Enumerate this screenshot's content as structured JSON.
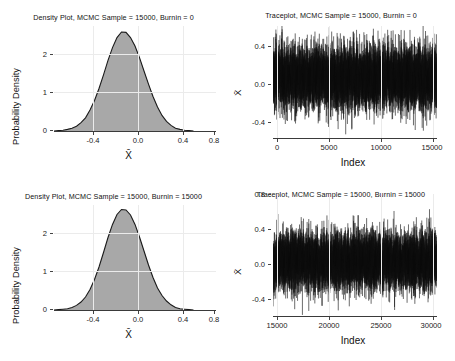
{
  "figure": {
    "background": "#ffffff",
    "panel_count": 4,
    "layout": "2x2 grid"
  },
  "colors": {
    "density_fill_light": "#a8a8a8",
    "density_fill_dark": "#6f6f6f",
    "density_outline": "#1a1a1a",
    "trace_line": "#111111",
    "gridline": "#ebebeb",
    "axis": "#3a3a3a",
    "text": "#111111"
  },
  "chart_data": [
    {
      "type": "area",
      "panel": "top-left",
      "title": "Density Plot, MCMC Sample = 15000, Burnin = 0",
      "xlabel": "X̄",
      "ylabel": "Probability Density",
      "xlim": [
        -0.62,
        0.82
      ],
      "ylim": [
        0,
        2.62
      ],
      "xticks": [
        -0.4,
        0.0,
        0.4,
        0.8
      ],
      "xticklabels": [
        "-0.4",
        "0.0",
        "0.4",
        "0.8"
      ],
      "yticks": [
        0,
        1,
        2
      ],
      "yticklabels": [
        "0",
        "1",
        "2"
      ],
      "grid": true,
      "mean": 0.055,
      "sd": 0.165,
      "peak_density": 2.45,
      "shaded_interval": [
        -0.05,
        0.175
      ],
      "shaded_interval_label": "credible interval (darker band)",
      "x": [
        -0.62,
        -0.58,
        -0.54,
        -0.5,
        -0.46,
        -0.42,
        -0.38,
        -0.34,
        -0.3,
        -0.26,
        -0.22,
        -0.18,
        -0.14,
        -0.1,
        -0.06,
        -0.02,
        0.02,
        0.06,
        0.1,
        0.14,
        0.18,
        0.22,
        0.26,
        0.3,
        0.34,
        0.38,
        0.42,
        0.46,
        0.5,
        0.54,
        0.58,
        0.62,
        0.66,
        0.7,
        0.74,
        0.78,
        0.82
      ],
      "y": [
        0.0,
        0.01,
        0.02,
        0.04,
        0.07,
        0.12,
        0.21,
        0.33,
        0.52,
        0.76,
        1.06,
        1.4,
        1.76,
        2.08,
        2.33,
        2.45,
        2.44,
        2.33,
        2.12,
        1.83,
        1.5,
        1.17,
        0.86,
        0.6,
        0.39,
        0.24,
        0.14,
        0.07,
        0.04,
        0.02,
        0.01,
        0.0,
        0.0,
        0.0,
        0.0,
        0.0,
        0.0
      ]
    },
    {
      "type": "line",
      "panel": "top-right",
      "title": "Traceplot, MCMC Sample = 15000, Burnin = 0",
      "xlabel": "Index",
      "ylabel": "X̄",
      "xlim": [
        0,
        15000
      ],
      "ylim": [
        -0.62,
        0.62
      ],
      "xticks": [
        0,
        5000,
        10000,
        15000
      ],
      "xticklabels": [
        "0",
        "5000",
        "10000",
        "15000"
      ],
      "yticks": [
        -0.4,
        0.0,
        0.4
      ],
      "yticklabels": [
        "-0.4",
        "0.0",
        "0.4"
      ],
      "grid": true,
      "n_samples": 15000,
      "series_mean": 0.055,
      "series_sd": 0.165,
      "description": "dense black MCMC trace, stationary, no visible trend"
    },
    {
      "type": "area",
      "panel": "bottom-left",
      "title": "Density Plot, MCMC Sample = 15000, Burnin = 15000",
      "xlabel": "X̄",
      "ylabel": "Probability Density",
      "xlim": [
        -0.62,
        0.82
      ],
      "ylim": [
        0,
        2.62
      ],
      "xticks": [
        -0.4,
        0.0,
        0.4,
        0.8
      ],
      "xticklabels": [
        "-0.4",
        "0.0",
        "0.4",
        "0.8"
      ],
      "yticks": [
        0,
        1,
        2
      ],
      "yticklabels": [
        "0",
        "1",
        "2"
      ],
      "grid": true,
      "mean": 0.055,
      "sd": 0.16,
      "peak_density": 2.5,
      "shaded_interval": [
        -0.05,
        0.175
      ],
      "shaded_interval_label": "credible interval (darker band)",
      "x": [
        -0.62,
        -0.58,
        -0.54,
        -0.5,
        -0.46,
        -0.42,
        -0.38,
        -0.34,
        -0.3,
        -0.26,
        -0.22,
        -0.18,
        -0.14,
        -0.1,
        -0.06,
        -0.02,
        0.02,
        0.06,
        0.1,
        0.14,
        0.18,
        0.22,
        0.26,
        0.3,
        0.34,
        0.38,
        0.42,
        0.46,
        0.5,
        0.54,
        0.58,
        0.62,
        0.66,
        0.7,
        0.74,
        0.78,
        0.82
      ],
      "y": [
        0.0,
        0.01,
        0.02,
        0.03,
        0.06,
        0.11,
        0.19,
        0.31,
        0.5,
        0.75,
        1.06,
        1.42,
        1.8,
        2.13,
        2.38,
        2.5,
        2.48,
        2.36,
        2.13,
        1.82,
        1.47,
        1.13,
        0.82,
        0.55,
        0.35,
        0.21,
        0.12,
        0.06,
        0.03,
        0.02,
        0.01,
        0.0,
        0.0,
        0.0,
        0.0,
        0.0,
        0.0
      ]
    },
    {
      "type": "line",
      "panel": "bottom-right",
      "title": "Traceplot, MCMC Sample = 15000, Burnin = 15000",
      "xlabel": "Index",
      "ylabel": "X̄",
      "xlim": [
        15000,
        30000
      ],
      "ylim": [
        -0.62,
        0.88
      ],
      "xticks": [
        15000,
        20000,
        25000,
        30000
      ],
      "xticklabels": [
        "15000",
        "20000",
        "25000",
        "30000"
      ],
      "yticks": [
        -0.4,
        0.0,
        0.4,
        0.8
      ],
      "yticklabels": [
        "-0.4",
        "0.0",
        "0.4",
        "0.8"
      ],
      "grid": true,
      "n_samples": 15000,
      "series_mean": 0.055,
      "series_sd": 0.165,
      "description": "dense black MCMC trace, stationary, no visible trend"
    }
  ]
}
